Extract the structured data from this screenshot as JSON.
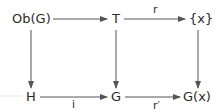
{
  "diagram": {
    "type": "commutative-square",
    "nodes": {
      "ob_g": "Ob(G)",
      "t": "T",
      "x_set": "{x}",
      "h": "H",
      "g": "G",
      "g_x": "G(x)"
    },
    "arrows": [
      {
        "from": "Ob(G)",
        "to": "T",
        "label": ""
      },
      {
        "from": "T",
        "to": "{x}",
        "label": "r"
      },
      {
        "from": "Ob(G)",
        "to": "H",
        "label": ""
      },
      {
        "from": "T",
        "to": "G",
        "label": ""
      },
      {
        "from": "{x}",
        "to": "G(x)",
        "label": ""
      },
      {
        "from": "H",
        "to": "G",
        "label": "i"
      },
      {
        "from": "G",
        "to": "G(x)",
        "label": "r′"
      }
    ],
    "labels": {
      "r": "r",
      "i": "i",
      "r_prime": "r′"
    },
    "colors": {
      "ink": "#2a2a2a",
      "arrow": "#555555"
    }
  }
}
